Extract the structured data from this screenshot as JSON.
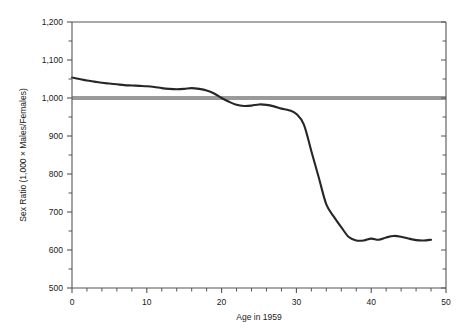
{
  "chart_data": {
    "type": "line",
    "title": "",
    "xlabel": "Age in 1959",
    "ylabel": "Sex Ratio  (1,000 × Males/Females)",
    "xlim": [
      0,
      50
    ],
    "ylim": [
      500,
      1200
    ],
    "x_major_ticks": [
      0,
      10,
      20,
      30,
      40,
      50
    ],
    "x_major_tick_labels": [
      "0",
      "10",
      "20",
      "30",
      "40",
      "50"
    ],
    "x_minor_tick_step": 2,
    "y_major_ticks": [
      500,
      600,
      700,
      800,
      900,
      1000,
      1100,
      1200
    ],
    "y_major_tick_labels": [
      "500",
      "600",
      "700",
      "800",
      "900",
      "1,000",
      "1,100",
      "1,200"
    ],
    "y_minor_tick_step": 50,
    "grid": false,
    "legend": null,
    "series": [
      {
        "name": "Sex ratio by age",
        "color": "#262626",
        "x": [
          0,
          1,
          2,
          3,
          4,
          5,
          6,
          7,
          8,
          9,
          10,
          11,
          12,
          13,
          14,
          15,
          16,
          17,
          18,
          19,
          20,
          21,
          22,
          23,
          24,
          25,
          26,
          27,
          28,
          29,
          30,
          31,
          32,
          33,
          34,
          35,
          36,
          37,
          38,
          39,
          40,
          41,
          42,
          43,
          44,
          45,
          46,
          47,
          48
        ],
        "values": [
          1054,
          1050,
          1046,
          1043,
          1040,
          1038,
          1036,
          1034,
          1033,
          1032,
          1031,
          1029,
          1026,
          1024,
          1023,
          1024,
          1026,
          1024,
          1020,
          1012,
          1000,
          990,
          982,
          979,
          980,
          983,
          982,
          978,
          972,
          968,
          958,
          930,
          860,
          790,
          720,
          688,
          660,
          634,
          625,
          625,
          630,
          627,
          633,
          637,
          635,
          630,
          626,
          625,
          627
        ]
      }
    ],
    "reference_line": {
      "name": "parity-line",
      "value": 1000,
      "color": "#9a9a9a",
      "thickness_px": 4
    }
  },
  "axes": {
    "frame_color": "#555555",
    "background": "#ffffff"
  }
}
